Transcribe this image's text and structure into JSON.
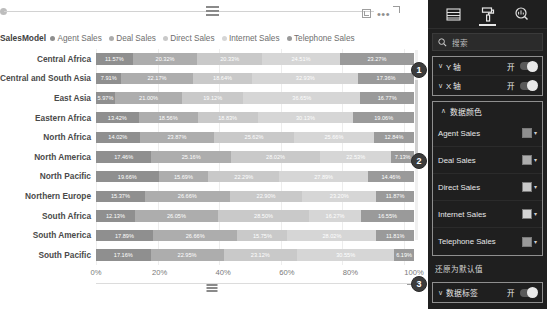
{
  "chart": {
    "actions": {
      "focus_icon": "focus-mode-icon",
      "more_icon": "more-options-icon",
      "more_label": "•••"
    },
    "legend_title": "SalesModel"
  },
  "panel": {
    "tabs": [
      {
        "name": "fields",
        "icon": "fields-list-icon",
        "active": false
      },
      {
        "name": "format",
        "icon": "paint-roller-icon",
        "active": true
      },
      {
        "name": "analytics",
        "icon": "magnifier-analytics-icon",
        "active": false
      }
    ],
    "search": {
      "placeholder": "搜索",
      "icon": "search-icon",
      "value": ""
    },
    "axis_options": [
      {
        "label": "Y 轴",
        "state": "开",
        "chevron": "∨"
      },
      {
        "label": "X 轴",
        "state": "开",
        "chevron": "∨"
      }
    ],
    "data_colors": {
      "title": "数据颜色",
      "chevron": "∨",
      "items": [
        {
          "name": "Agent Sales",
          "color": "#8f8f8f"
        },
        {
          "name": "Deal Sales",
          "color": "#adadad"
        },
        {
          "name": "Direct Sales",
          "color": "#c9c9c9"
        },
        {
          "name": "Internet Sales",
          "color": "#d6d6d6"
        },
        {
          "name": "Telephone Sales",
          "color": "#9a9a9a"
        }
      ],
      "caret": "▾"
    },
    "restore_label": "还原为默认值",
    "data_labels": {
      "label": "数据标签",
      "state": "开",
      "chevron": "∨"
    }
  },
  "annotations": [
    {
      "id": "1",
      "label": "1"
    },
    {
      "id": "2",
      "label": "2"
    },
    {
      "id": "3",
      "label": "3"
    }
  ],
  "chart_data": {
    "type": "bar",
    "title": "",
    "subtype": "100% stacked horizontal bar",
    "xlabel": "",
    "ylabel": "",
    "xlim": [
      0,
      100
    ],
    "grid": true,
    "legend_position": "top-left",
    "legend_title": "SalesModel",
    "xticks": [
      "0%",
      "20%",
      "40%",
      "60%",
      "80%",
      "100%"
    ],
    "categories": [
      "Central Africa",
      "Central and South Asia",
      "East Asia",
      "Eastern Africa",
      "North Africa",
      "North America",
      "North Pacific",
      "Northern Europe",
      "South Africa",
      "South America",
      "South Pacific"
    ],
    "series": [
      {
        "name": "Agent Sales",
        "color": "#8f8f8f",
        "values": [
          11.57,
          7.91,
          5.97,
          13.42,
          14.02,
          17.46,
          19.66,
          15.37,
          12.13,
          17.89,
          17.16
        ]
      },
      {
        "name": "Deal Sales",
        "color": "#adadad",
        "values": [
          20.32,
          22.17,
          21.0,
          18.56,
          23.87,
          25.16,
          15.69,
          26.66,
          26.05,
          26.66,
          22.95
        ]
      },
      {
        "name": "Direct Sales",
        "color": "#c9c9c9",
        "values": [
          20.33,
          18.64,
          19.12,
          18.83,
          25.62,
          28.02,
          22.29,
          22.9,
          28.5,
          15.75,
          23.12
        ]
      },
      {
        "name": "Internet Sales",
        "color": "#d6d6d6",
        "values": [
          24.51,
          32.93,
          36.65,
          30.13,
          25.66,
          22.53,
          27.89,
          23.2,
          16.27,
          28.02,
          30.55
        ]
      },
      {
        "name": "Telephone Sales",
        "color": "#9a9a9a",
        "values": [
          23.27,
          17.36,
          16.77,
          19.06,
          12.84,
          7.13,
          14.46,
          11.87,
          16.55,
          11.81,
          6.19
        ]
      }
    ],
    "labels": [
      [
        "11.57%",
        "20.32%",
        "20.33%",
        "24.51%",
        "23.27%"
      ],
      [
        "7.91%",
        "22.17%",
        "18.64%",
        "32.93%",
        "17.36%"
      ],
      [
        "5.97%",
        "21.00%",
        "19.12%",
        "36.65%",
        "16.77%"
      ],
      [
        "13.42%",
        "18.56%",
        "18.83%",
        "30.13%",
        "19.06%"
      ],
      [
        "14.02%",
        "23.87%",
        "25.62%",
        "25.66%",
        "12.84%"
      ],
      [
        "17.46%",
        "25.16%",
        "28.02%",
        "22.53%",
        "7.13%"
      ],
      [
        "19.66%",
        "15.69%",
        "22.29%",
        "27.89%",
        "14.46%"
      ],
      [
        "15.37%",
        "26.66%",
        "22.90%",
        "23.20%",
        "11.87%"
      ],
      [
        "12.13%",
        "26.05%",
        "28.50%",
        "16.27%",
        "16.55%"
      ],
      [
        "17.89%",
        "26.66%",
        "15.75%",
        "28.02%",
        "11.81%"
      ],
      [
        "17.16%",
        "22.95%",
        "23.12%",
        "30.55%",
        "6.19%"
      ]
    ]
  }
}
